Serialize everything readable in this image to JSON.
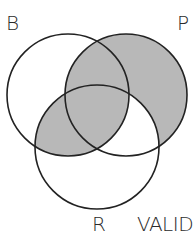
{
  "diagram": {
    "type": "venn",
    "sets": [
      {
        "name": "B",
        "cx": 68,
        "cy": 95,
        "r": 61
      },
      {
        "name": "P",
        "cx": 126,
        "cy": 95,
        "r": 61
      },
      {
        "name": "R",
        "cx": 97,
        "cy": 147,
        "r": 62
      }
    ],
    "labels": {
      "B": "B",
      "P": "P",
      "R": "R",
      "status": "VALID"
    },
    "shaded_regions": [
      "P only",
      "B and P (not R)",
      "B and P and R",
      "B and R (not P)"
    ],
    "unshaded_regions": [
      "B only",
      "R only",
      "P and R (not B)"
    ],
    "colors": {
      "shade": "#b8b8b8",
      "stroke": "#222222",
      "background": "#ffffff"
    }
  }
}
